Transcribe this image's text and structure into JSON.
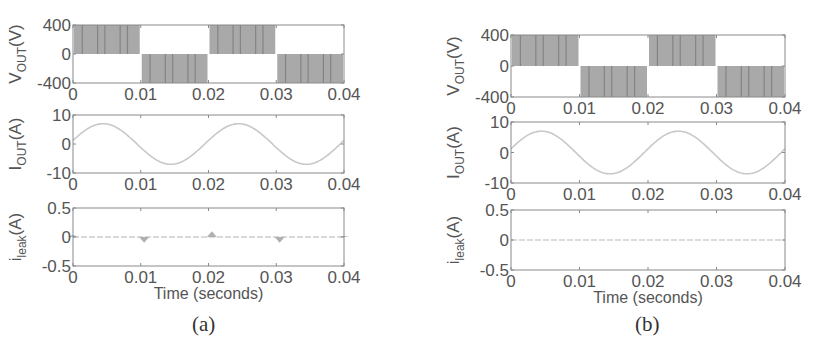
{
  "figure": {
    "panels": [
      {
        "id": "a",
        "caption": "(a)"
      },
      {
        "id": "b",
        "caption": "(b)"
      }
    ]
  },
  "labels": {
    "vout_main": "V",
    "vout_sub": "OUT",
    "vout_unit": "(V)",
    "iout_main": "I",
    "iout_sub": "OUT",
    "iout_unit": "(A)",
    "ileak_main": "i",
    "ileak_sub": "leak",
    "ileak_unit": "(A)",
    "xlabel": "Time (seconds)"
  },
  "ticks": {
    "x": [
      "0",
      "0.01",
      "0.02",
      "0.03",
      "0.04"
    ],
    "vout_y": [
      "400",
      "0",
      "-400"
    ],
    "iout_y": [
      "10",
      "0",
      "-10"
    ],
    "ileak_y": [
      "0.5",
      "0",
      "-0.5"
    ]
  },
  "colors": {
    "pwm_fill": "#a9a9a9",
    "pwm_lines": "#7c7c7c",
    "trace": "#c8c8c8",
    "axes": "#8a8a8a"
  },
  "chart_data": [
    {
      "panel": "a",
      "type": "line",
      "title": "",
      "xlabel": "Time (seconds)",
      "subplots": [
        {
          "ylabel": "V_OUT (V)",
          "xlim": [
            0,
            0.04
          ],
          "ylim": [
            -400,
            400
          ],
          "description": "Unipolar-like PWM: switching between 0 and +400 V during positive half cycles, 0 and -400 V during negative half cycles",
          "segments": [
            {
              "x_start": 0.0,
              "x_end": 0.01,
              "level": 400
            },
            {
              "x_start": 0.01,
              "x_end": 0.02,
              "level": -400
            },
            {
              "x_start": 0.02,
              "x_end": 0.03,
              "level": 400
            },
            {
              "x_start": 0.03,
              "x_end": 0.04,
              "level": -400
            }
          ]
        },
        {
          "ylabel": "I_OUT (A)",
          "xlim": [
            0,
            0.04
          ],
          "ylim": [
            -10,
            10
          ],
          "series": [
            {
              "name": "I_OUT",
              "type": "sine",
              "amplitude": 7,
              "frequency_hz": 50,
              "phase_deg": 10
            }
          ],
          "x": [
            0,
            0.005,
            0.01,
            0.015,
            0.02,
            0.025,
            0.03,
            0.035,
            0.04
          ],
          "values": [
            1.2,
            7,
            1.2,
            -7,
            1.2,
            7,
            1.2,
            -7,
            1.2
          ]
        },
        {
          "ylabel": "i_leak (A)",
          "xlim": [
            0,
            0.04
          ],
          "ylim": [
            -0.5,
            0.5
          ],
          "series": [
            {
              "name": "i_leak",
              "description": "near-zero with small spikes at zero-crossings"
            }
          ],
          "x": [
            0,
            0.0105,
            0.0205,
            0.0305,
            0.04
          ],
          "values": [
            0.04,
            -0.1,
            0.1,
            -0.1,
            0.02
          ]
        }
      ]
    },
    {
      "panel": "b",
      "type": "line",
      "title": "",
      "xlabel": "Time (seconds)",
      "subplots": [
        {
          "ylabel": "V_OUT (V)",
          "xlim": [
            0,
            0.04
          ],
          "ylim": [
            -400,
            400
          ],
          "segments": [
            {
              "x_start": 0.0,
              "x_end": 0.01,
              "level": 400
            },
            {
              "x_start": 0.01,
              "x_end": 0.02,
              "level": -400
            },
            {
              "x_start": 0.02,
              "x_end": 0.03,
              "level": 400
            },
            {
              "x_start": 0.03,
              "x_end": 0.04,
              "level": -400
            }
          ]
        },
        {
          "ylabel": "I_OUT (A)",
          "xlim": [
            0,
            0.04
          ],
          "ylim": [
            -10,
            10
          ],
          "series": [
            {
              "name": "I_OUT",
              "type": "sine",
              "amplitude": 7,
              "frequency_hz": 50,
              "phase_deg": 10
            }
          ],
          "x": [
            0,
            0.005,
            0.01,
            0.015,
            0.02,
            0.025,
            0.03,
            0.035,
            0.04
          ],
          "values": [
            1.2,
            7,
            1.2,
            -7,
            1.2,
            7,
            1.2,
            -7,
            1.2
          ]
        },
        {
          "ylabel": "i_leak (A)",
          "xlim": [
            0,
            0.04
          ],
          "ylim": [
            -0.5,
            0.5
          ],
          "series": [
            {
              "name": "i_leak",
              "description": "essentially zero throughout"
            }
          ],
          "x": [
            0,
            0.01,
            0.02,
            0.03,
            0.04
          ],
          "values": [
            0,
            0,
            0,
            0,
            0
          ]
        }
      ]
    }
  ]
}
